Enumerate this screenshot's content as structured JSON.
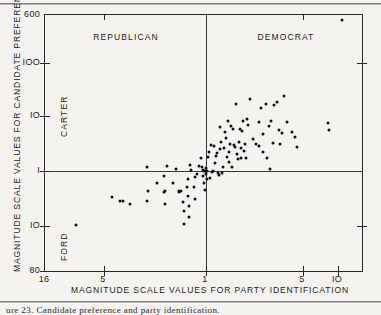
{
  "figure": {
    "type": "scatter-plot-scan",
    "background": "#f4f3f0",
    "ink": "#1d1c1a"
  },
  "caption": "ure  23.  Candidate preference and party identification.",
  "chart_data": {
    "type": "scatter",
    "title": "",
    "xlabel": "MAGNITUDE SCALE VALUES FOR PARTY IDENTIFICATION",
    "ylabel": "MAGNITUDE SCALE VALUES FOR CANDIDATE PREFERENCE",
    "grid": false,
    "legend": "none",
    "x_axis": {
      "label": "MAGNITUDE SCALE VALUES FOR PARTY IDENTIFICATION",
      "scale": "mirrored-log",
      "center_value": "1",
      "left_branch_label": "REPUBLICAN",
      "right_branch_label": "DEMOCRAT",
      "tick_labels": [
        "16",
        "5",
        "1",
        "5",
        "IO"
      ],
      "tick_positions_px": [
        44,
        103,
        205,
        302,
        337
      ]
    },
    "y_axis": {
      "label": "MAGNITUDE SCALE VALUES FOR CANDIDATE PREFERENCE",
      "scale": "mirrored-log-inverted",
      "center_value": "1",
      "upper_branch_label": "CARTER",
      "lower_branch_label": "FORD",
      "tick_labels": [
        "600",
        "IOO",
        "IO",
        "I",
        "IO",
        "80"
      ],
      "tick_positions_px": [
        14,
        62,
        115,
        170,
        225,
        270
      ]
    },
    "quadrant_labels": [
      {
        "text": "REPUBLICAN",
        "x_px": 125,
        "y_px": 31
      },
      {
        "text": "DEMOCRAT",
        "x_px": 285,
        "y_px": 31
      }
    ],
    "n_points": 112,
    "points_px": [
      [
        341,
        19
      ],
      [
        75,
        224
      ],
      [
        111,
        196
      ],
      [
        119,
        200
      ],
      [
        122,
        200
      ],
      [
        129,
        203
      ],
      [
        146,
        166
      ],
      [
        146,
        200
      ],
      [
        147,
        190
      ],
      [
        156,
        182
      ],
      [
        163,
        175
      ],
      [
        163,
        191
      ],
      [
        164,
        190
      ],
      [
        164,
        203
      ],
      [
        166,
        165
      ],
      [
        172,
        182
      ],
      [
        175,
        168
      ],
      [
        178,
        190
      ],
      [
        178,
        191
      ],
      [
        180,
        190
      ],
      [
        182,
        201
      ],
      [
        183,
        210
      ],
      [
        183,
        223
      ],
      [
        186,
        186
      ],
      [
        187,
        178
      ],
      [
        187,
        195
      ],
      [
        188,
        205
      ],
      [
        188,
        216
      ],
      [
        189,
        164
      ],
      [
        190,
        169
      ],
      [
        193,
        186
      ],
      [
        194,
        176
      ],
      [
        194,
        198
      ],
      [
        196,
        173
      ],
      [
        198,
        165
      ],
      [
        200,
        157
      ],
      [
        201,
        166
      ],
      [
        202,
        169
      ],
      [
        202,
        175
      ],
      [
        203,
        170
      ],
      [
        203,
        182
      ],
      [
        204,
        170
      ],
      [
        204,
        189
      ],
      [
        205,
        167
      ],
      [
        205,
        170
      ],
      [
        205,
        173
      ],
      [
        206,
        170
      ],
      [
        206,
        178
      ],
      [
        207,
        156
      ],
      [
        208,
        151
      ],
      [
        209,
        177
      ],
      [
        210,
        144
      ],
      [
        211,
        171
      ],
      [
        212,
        170
      ],
      [
        213,
        145
      ],
      [
        214,
        162
      ],
      [
        215,
        155
      ],
      [
        216,
        152
      ],
      [
        217,
        172
      ],
      [
        218,
        174
      ],
      [
        219,
        126
      ],
      [
        219,
        148
      ],
      [
        220,
        141
      ],
      [
        221,
        172
      ],
      [
        222,
        166
      ],
      [
        223,
        147
      ],
      [
        224,
        131
      ],
      [
        225,
        137
      ],
      [
        226,
        156
      ],
      [
        227,
        120
      ],
      [
        228,
        151
      ],
      [
        228,
        161
      ],
      [
        229,
        143
      ],
      [
        230,
        125
      ],
      [
        231,
        166
      ],
      [
        232,
        128
      ],
      [
        233,
        144
      ],
      [
        234,
        146
      ],
      [
        235,
        103
      ],
      [
        236,
        153
      ],
      [
        237,
        158
      ],
      [
        238,
        141
      ],
      [
        239,
        128
      ],
      [
        240,
        147
      ],
      [
        240,
        157
      ],
      [
        241,
        130
      ],
      [
        242,
        120
      ],
      [
        243,
        150
      ],
      [
        244,
        143
      ],
      [
        245,
        157
      ],
      [
        246,
        118
      ],
      [
        247,
        124
      ],
      [
        249,
        98
      ],
      [
        252,
        138
      ],
      [
        255,
        143
      ],
      [
        258,
        121
      ],
      [
        258,
        145
      ],
      [
        260,
        107
      ],
      [
        262,
        133
      ],
      [
        262,
        151
      ],
      [
        265,
        103
      ],
      [
        266,
        157
      ],
      [
        268,
        125
      ],
      [
        269,
        168
      ],
      [
        270,
        120
      ],
      [
        272,
        142
      ],
      [
        273,
        104
      ],
      [
        276,
        101
      ],
      [
        278,
        129
      ],
      [
        279,
        143
      ],
      [
        281,
        132
      ],
      [
        283,
        95
      ],
      [
        286,
        121
      ],
      [
        291,
        131
      ],
      [
        294,
        136
      ],
      [
        296,
        146
      ],
      [
        327,
        122
      ],
      [
        328,
        129
      ]
    ]
  }
}
